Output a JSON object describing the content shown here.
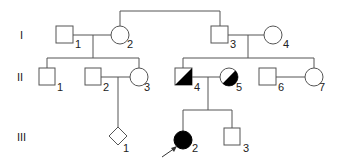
{
  "diagram": {
    "type": "pedigree",
    "generations": [
      {
        "label": "I",
        "y": 35
      },
      {
        "label": "II",
        "y": 77
      },
      {
        "label": "III",
        "y": 137
      }
    ],
    "individuals": [
      {
        "id": "I-1",
        "gen": "I",
        "num": "1",
        "sex": "male",
        "status": "unaffected"
      },
      {
        "id": "I-2",
        "gen": "I",
        "num": "2",
        "sex": "female",
        "status": "unaffected"
      },
      {
        "id": "I-3",
        "gen": "I",
        "num": "3",
        "sex": "male",
        "status": "unaffected"
      },
      {
        "id": "I-4",
        "gen": "I",
        "num": "4",
        "sex": "female",
        "status": "unaffected"
      },
      {
        "id": "II-1",
        "gen": "II",
        "num": "1",
        "sex": "male",
        "status": "unaffected"
      },
      {
        "id": "II-2",
        "gen": "II",
        "num": "2",
        "sex": "male",
        "status": "unaffected"
      },
      {
        "id": "II-3",
        "gen": "II",
        "num": "3",
        "sex": "female",
        "status": "unaffected"
      },
      {
        "id": "II-4",
        "gen": "II",
        "num": "4",
        "sex": "male",
        "status": "carrier-half-filled"
      },
      {
        "id": "II-5",
        "gen": "II",
        "num": "5",
        "sex": "female",
        "status": "carrier-half-filled"
      },
      {
        "id": "II-6",
        "gen": "II",
        "num": "6",
        "sex": "male",
        "status": "unaffected"
      },
      {
        "id": "II-7",
        "gen": "II",
        "num": "7",
        "sex": "female",
        "status": "unaffected"
      },
      {
        "id": "III-1",
        "gen": "III",
        "num": "1",
        "sex": "unknown",
        "status": "unaffected"
      },
      {
        "id": "III-2",
        "gen": "III",
        "num": "2",
        "sex": "female",
        "status": "affected",
        "proband": true
      },
      {
        "id": "III-3",
        "gen": "III",
        "num": "3",
        "sex": "male",
        "status": "unaffected"
      }
    ],
    "colors": {
      "line": "#555555",
      "fill": "#000000",
      "background": "#ffffff"
    }
  }
}
